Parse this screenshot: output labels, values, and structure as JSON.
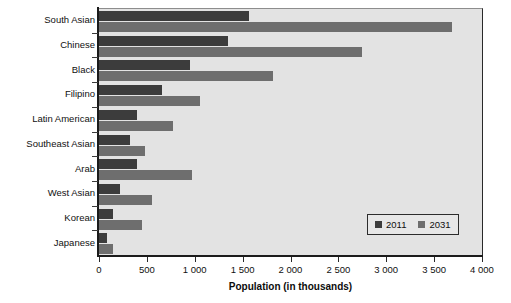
{
  "chart_data": {
    "type": "bar",
    "orientation": "horizontal",
    "title": "",
    "xlabel": "Population (in thousands)",
    "ylabel": "",
    "xlim": [
      0,
      4000
    ],
    "xticks": [
      0,
      500,
      1000,
      1500,
      2000,
      2500,
      3000,
      3500,
      4000
    ],
    "xtick_labels": [
      "0",
      "500",
      "1 000",
      "1 500",
      "2 000",
      "2 500",
      "3 000",
      "3 500",
      "4 000"
    ],
    "grid": false,
    "legend_position": "inside lower-right",
    "categories": [
      "South Asian",
      "Chinese",
      "Black",
      "Filipino",
      "Latin American",
      "Southeast Asian",
      "Arab",
      "West Asian",
      "Korean",
      "Japanese"
    ],
    "series": [
      {
        "name": "2011",
        "color": "#3c3c3c",
        "values": [
          1570,
          1350,
          950,
          655,
          400,
          320,
          400,
          215,
          150,
          85
        ]
      },
      {
        "name": "2031",
        "color": "#6e6e6e",
        "values": [
          3690,
          2750,
          1820,
          1050,
          770,
          480,
          970,
          555,
          450,
          150
        ]
      }
    ]
  },
  "legend": {
    "entries": [
      {
        "label": "2011",
        "color": "#3c3c3c"
      },
      {
        "label": "2031",
        "color": "#6e6e6e"
      }
    ]
  },
  "colors": {
    "plot_background": "#e3e3e3",
    "page_background": "#ffffff",
    "axis": "#1b1b1b",
    "series_2011": "#3c3c3c",
    "series_2031": "#6e6e6e"
  }
}
